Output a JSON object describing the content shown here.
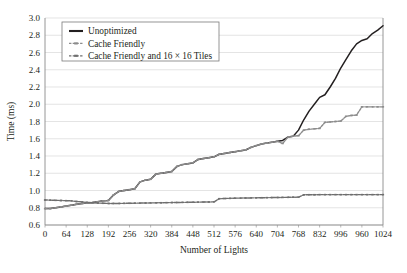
{
  "chart_data": {
    "type": "line",
    "title": "",
    "xlabel": "Number of Lights",
    "ylabel": "Time (ms)",
    "xlim": [
      0,
      1024
    ],
    "ylim": [
      0.6,
      3.0
    ],
    "grid": "horizontal",
    "legend_position": "top-left",
    "x_ticks": [
      0,
      64,
      128,
      192,
      256,
      320,
      384,
      448,
      512,
      576,
      640,
      704,
      768,
      832,
      996,
      960,
      1024
    ],
    "x_tick_labels": [
      "0",
      "64",
      "128",
      "192",
      "256",
      "320",
      "384",
      "448",
      "512",
      "576",
      "640",
      "704",
      "768",
      "832",
      "996",
      "960",
      "1024"
    ],
    "y_ticks": [
      0.6,
      0.8,
      1.0,
      1.2,
      1.4,
      1.6,
      1.8,
      2.0,
      2.2,
      2.4,
      2.6,
      2.8,
      3.0
    ],
    "y_tick_labels": [
      "0.6",
      "0.8",
      "1.0",
      "1.2",
      "1.4",
      "1.6",
      "1.8",
      "2.0",
      "2.2",
      "2.4",
      "2.6",
      "2.8",
      "3.0"
    ],
    "x": [
      0,
      16,
      32,
      48,
      64,
      80,
      96,
      112,
      128,
      144,
      160,
      176,
      192,
      208,
      224,
      240,
      256,
      272,
      288,
      304,
      320,
      336,
      352,
      368,
      384,
      400,
      416,
      432,
      448,
      464,
      480,
      496,
      512,
      528,
      544,
      560,
      576,
      592,
      608,
      624,
      640,
      656,
      672,
      688,
      704,
      720,
      736,
      752,
      768,
      784,
      800,
      816,
      832,
      848,
      864,
      880,
      896,
      912,
      928,
      944,
      960,
      976,
      992,
      1008,
      1024
    ],
    "series": [
      {
        "name": "Unoptimized",
        "color": "#231f20",
        "style": "solid",
        "marker": "none",
        "values": [
          0.79,
          0.79,
          0.8,
          0.81,
          0.82,
          0.83,
          0.84,
          0.85,
          0.855,
          0.86,
          0.87,
          0.88,
          0.885,
          0.95,
          0.99,
          1.0,
          1.01,
          1.02,
          1.1,
          1.12,
          1.13,
          1.19,
          1.2,
          1.21,
          1.22,
          1.28,
          1.3,
          1.31,
          1.32,
          1.36,
          1.37,
          1.38,
          1.39,
          1.42,
          1.43,
          1.44,
          1.45,
          1.46,
          1.47,
          1.5,
          1.52,
          1.54,
          1.55,
          1.56,
          1.57,
          1.58,
          1.62,
          1.63,
          1.7,
          1.82,
          1.92,
          2.0,
          2.08,
          2.11,
          2.2,
          2.3,
          2.42,
          2.52,
          2.62,
          2.7,
          2.74,
          2.76,
          2.82,
          2.86,
          2.91
        ]
      },
      {
        "name": "Cache Friendly",
        "color": "#8c8c8c",
        "style": "dotted",
        "marker": "dash",
        "values": [
          0.79,
          0.79,
          0.8,
          0.81,
          0.82,
          0.83,
          0.84,
          0.85,
          0.855,
          0.86,
          0.87,
          0.88,
          0.885,
          0.95,
          0.99,
          1.0,
          1.01,
          1.02,
          1.1,
          1.12,
          1.13,
          1.19,
          1.2,
          1.21,
          1.22,
          1.28,
          1.3,
          1.31,
          1.32,
          1.36,
          1.37,
          1.38,
          1.39,
          1.42,
          1.43,
          1.44,
          1.45,
          1.46,
          1.47,
          1.5,
          1.52,
          1.54,
          1.55,
          1.56,
          1.57,
          1.545,
          1.62,
          1.63,
          1.635,
          1.7,
          1.71,
          1.715,
          1.72,
          1.79,
          1.795,
          1.8,
          1.805,
          1.86,
          1.87,
          1.875,
          1.97,
          1.97,
          1.97,
          1.97,
          1.97
        ]
      },
      {
        "name": "Cache Friendly and 16 × 16 Tiles",
        "color": "#6e6e6e",
        "style": "dotted",
        "marker": "dash",
        "values": [
          0.89,
          0.888,
          0.886,
          0.884,
          0.882,
          0.88,
          0.872,
          0.868,
          0.862,
          0.858,
          0.854,
          0.852,
          0.85,
          0.85,
          0.85,
          0.851,
          0.852,
          0.853,
          0.854,
          0.855,
          0.856,
          0.857,
          0.858,
          0.859,
          0.86,
          0.861,
          0.862,
          0.863,
          0.864,
          0.865,
          0.866,
          0.867,
          0.868,
          0.905,
          0.907,
          0.909,
          0.911,
          0.912,
          0.913,
          0.914,
          0.915,
          0.916,
          0.917,
          0.918,
          0.919,
          0.92,
          0.921,
          0.922,
          0.923,
          0.95,
          0.951,
          0.951,
          0.952,
          0.952,
          0.952,
          0.952,
          0.952,
          0.952,
          0.952,
          0.952,
          0.952,
          0.952,
          0.952,
          0.952,
          0.952
        ]
      }
    ]
  }
}
